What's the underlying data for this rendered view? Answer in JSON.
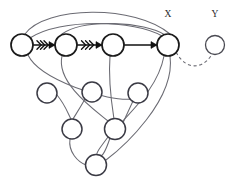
{
  "diagram": {
    "type": "graph-network-diagram",
    "width": 245,
    "height": 190,
    "background_color": "#ffffff",
    "labels": [
      {
        "id": "label-x",
        "text": "X",
        "x": 168,
        "y": 17
      },
      {
        "id": "label-y",
        "text": "Y",
        "x": 215,
        "y": 17
      }
    ],
    "nodes": [
      {
        "id": "n1",
        "x": 22,
        "y": 45,
        "r": 11,
        "style": "main",
        "label": ""
      },
      {
        "id": "n2",
        "x": 66,
        "y": 45,
        "r": 11,
        "style": "main",
        "label": ""
      },
      {
        "id": "n3",
        "x": 113,
        "y": 45,
        "r": 11,
        "style": "main",
        "label": ""
      },
      {
        "id": "nX",
        "x": 168,
        "y": 45,
        "r": 11,
        "style": "main",
        "label": "X"
      },
      {
        "id": "nY",
        "x": 215,
        "y": 45,
        "r": 9.5,
        "style": "faint",
        "label": "Y"
      },
      {
        "id": "n5",
        "x": 47,
        "y": 93,
        "r": 10,
        "style": "sub",
        "label": ""
      },
      {
        "id": "n6",
        "x": 92,
        "y": 92,
        "r": 10,
        "style": "sub",
        "label": ""
      },
      {
        "id": "n7",
        "x": 138,
        "y": 93,
        "r": 10,
        "style": "sub",
        "label": ""
      },
      {
        "id": "n8",
        "x": 72,
        "y": 129,
        "r": 10,
        "style": "sub",
        "label": ""
      },
      {
        "id": "n9",
        "x": 115,
        "y": 129,
        "r": 10.5,
        "style": "sub",
        "label": ""
      },
      {
        "id": "n10",
        "x": 96,
        "y": 165,
        "r": 10.5,
        "style": "sub",
        "label": ""
      }
    ],
    "chain_edges": [
      {
        "id": "edge-n1-n2",
        "from": "n1",
        "to": "n2",
        "x1": 33,
        "y1": 45,
        "x2": 55,
        "y2": 45,
        "chevrons": 3,
        "arrowhead": true
      },
      {
        "id": "edge-n2-n3",
        "from": "n2",
        "to": "n3",
        "x1": 77,
        "y1": 45,
        "x2": 102,
        "y2": 45,
        "chevrons": 3,
        "arrowhead": true
      },
      {
        "id": "edge-n3-nX",
        "from": "n3",
        "to": "nX",
        "x1": 124,
        "y1": 45,
        "x2": 157,
        "y2": 45,
        "chevrons": 0,
        "arrowhead": true
      }
    ],
    "curved_edges": [
      {
        "id": "edge-n1-nX-outer",
        "from": "n1",
        "to": "nX",
        "path": "M 25 34 C 45 6, 135 4, 170 34"
      },
      {
        "id": "edge-n1-nX-inner",
        "from": "n1",
        "to": "nX",
        "path": "M 30 38 C 60 18, 135 20, 162 36"
      },
      {
        "id": "edge-n2-nX-arc",
        "from": "n2",
        "to": "nX",
        "path": "M 62 34 C 85 18, 145 22, 165 35"
      },
      {
        "id": "edge-n1-n7",
        "from": "n1",
        "to": "n7",
        "path": "M 28 55 C 40 80, 108 102, 132 99"
      },
      {
        "id": "edge-n2-n9",
        "from": "n2",
        "to": "n9",
        "path": "M 62 56 C 56 82, 92 108, 108 121"
      },
      {
        "id": "edge-n3-n9",
        "from": "n3",
        "to": "n9",
        "path": "M 110 56 C 108 82, 112 106, 114 119"
      },
      {
        "id": "edge-nX-n9",
        "from": "nX",
        "to": "n9",
        "path": "M 164 56 C 158 88, 130 112, 122 122"
      },
      {
        "id": "edge-nX-n10",
        "from": "nX",
        "to": "n10",
        "path": "M 170 56 C 176 100, 122 148, 106 160"
      },
      {
        "id": "edge-n5-n8",
        "from": "n5",
        "to": "n8",
        "path": "M 57 95 C 66 106, 68 114, 71 119"
      },
      {
        "id": "edge-n6-n8",
        "from": "n6",
        "to": "n8",
        "path": "M 85 99 C 80 108, 76 114, 73 119"
      },
      {
        "id": "edge-n8-n10",
        "from": "n8",
        "to": "n10",
        "path": "M 70 139 C 68 152, 78 162, 86 165"
      },
      {
        "id": "edge-n9-n10",
        "from": "n9",
        "to": "n10",
        "path": "M 110 138 C 106 150, 102 158, 100 155"
      },
      {
        "id": "edge-n9-n10-b",
        "from": "n9",
        "to": "n10",
        "path": "M 108 137 C 99 149, 96 153, 97 155"
      },
      {
        "id": "edge-n7-n9",
        "from": "n7",
        "to": "n9",
        "path": "M 133 101 C 128 112, 124 120, 123 123"
      }
    ],
    "dashed_edges": [
      {
        "id": "edge-x-y-dashed",
        "from": "nX",
        "to": "nY",
        "path": "M 176 52 C 188 74, 206 66, 212 54"
      }
    ]
  }
}
